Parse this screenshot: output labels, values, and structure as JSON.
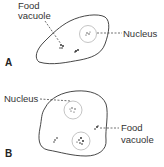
{
  "figure": {
    "panels": [
      {
        "id": "A",
        "label": "A",
        "annotations": {
          "food_vacuole_line1": "Food",
          "food_vacuole_line2": "vacuole",
          "nucleus": "Nucleus"
        }
      },
      {
        "id": "B",
        "label": "B",
        "annotations": {
          "nucleus": "Nucleus",
          "food_vacuole_line1": "Food",
          "food_vacuole_line2": "vacuole"
        }
      }
    ],
    "colors": {
      "stroke": "#333333",
      "text": "#333333",
      "background": "#ffffff"
    }
  }
}
